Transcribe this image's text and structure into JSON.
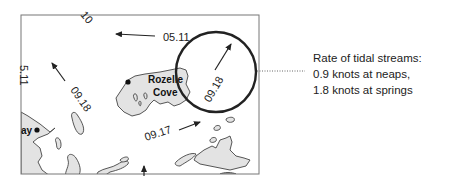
{
  "map": {
    "place_labels": [
      {
        "name": "rozelle-cove-label",
        "line1": "Rozelle",
        "line2": "Cove"
      },
      {
        "name": "bay-label",
        "text": "ay"
      }
    ],
    "stream_labels": [
      {
        "id": "top-edge",
        "text": "10"
      },
      {
        "id": "top-arrow",
        "text": "05.11"
      },
      {
        "id": "left-edge",
        "text": "5.11"
      },
      {
        "id": "mid-left",
        "text": "09.18"
      },
      {
        "id": "circled",
        "text": "09.18"
      },
      {
        "id": "bottom-mid",
        "text": "09.17"
      }
    ],
    "highlight_circle": {
      "color": "#222222"
    }
  },
  "caption": {
    "line1": "Rate of tidal streams:",
    "line2": "0.9 knots at neaps,",
    "line3": "1.8 knots at springs"
  },
  "colors": {
    "land": "#e3e3e3",
    "water": "#ffffff",
    "ink": "#222222"
  }
}
